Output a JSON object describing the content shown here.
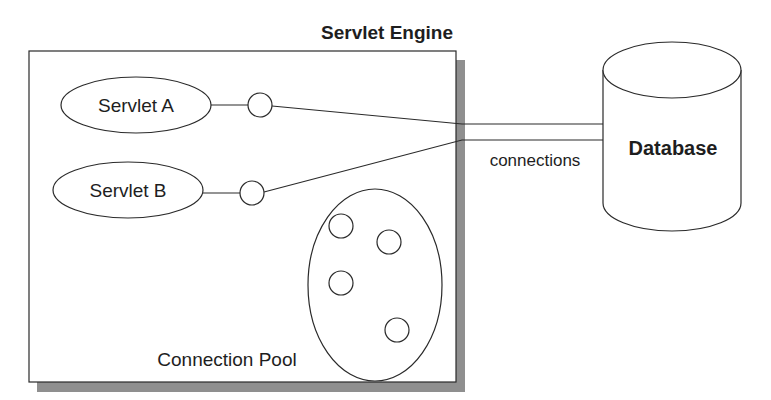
{
  "diagram": {
    "engine": {
      "label": "Servlet Engine"
    },
    "servlets": [
      {
        "label": "Servlet A"
      },
      {
        "label": "Servlet B"
      }
    ],
    "pool": {
      "label": "Connection Pool",
      "connection_count": 4
    },
    "link_label": "connections",
    "database": {
      "label": "Database"
    },
    "colors": {
      "stroke": "#2a2a2a",
      "shadow": "#8f8f8f",
      "text": "#1e1e1e",
      "background": "#ffffff"
    }
  }
}
